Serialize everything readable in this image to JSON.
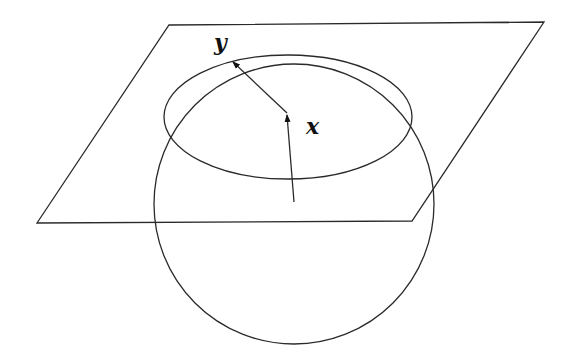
{
  "diagram": {
    "labels": {
      "point": "x",
      "tangent_vector": "y"
    },
    "elements": {
      "sphere": {
        "shape": "circle",
        "cx": 294,
        "cy": 204,
        "r": 140
      },
      "plane": {
        "shape": "parallelogram",
        "corners": [
          [
            169,
            25
          ],
          [
            544,
            22
          ],
          [
            412,
            221
          ],
          [
            37,
            223
          ]
        ]
      },
      "intersection_ellipse": {
        "shape": "ellipse",
        "cx": 288,
        "cy": 117,
        "rx": 124,
        "ry": 62
      },
      "normal_arrow": {
        "from": [
          294,
          202
        ],
        "to": [
          287,
          115
        ]
      },
      "tangent_arrow": {
        "from": [
          287,
          113
        ],
        "to": [
          233,
          62
        ]
      }
    },
    "colors": {
      "line": "#2a2a2a",
      "background": "#ffffff"
    }
  }
}
